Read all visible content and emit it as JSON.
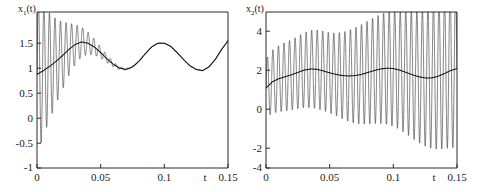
{
  "figure": {
    "background": "#ffffff",
    "curve_color": "#1c1c1c",
    "axis_color": "#2a2a2a"
  },
  "panels": [
    {
      "id": "left",
      "ylabel": "x",
      "ylabel_sub": "1",
      "ylabel_tail": "(t)",
      "xlabel": "t",
      "x_ticks": [
        "0",
        "0.05",
        "0.1",
        "0.15"
      ],
      "y_ticks": [
        "1.5",
        "1",
        "0.5",
        "0",
        "-0.5",
        "-1"
      ]
    },
    {
      "id": "right",
      "ylabel": "x",
      "ylabel_sub": "2",
      "ylabel_tail": "(t)",
      "xlabel": "t",
      "x_ticks": [
        "0",
        "0.05",
        "0.1",
        "0.15"
      ],
      "y_ticks": [
        "4",
        "2",
        "0",
        "-2",
        "-4"
      ]
    }
  ],
  "chart_data": [
    {
      "type": "line",
      "panel": "left",
      "title": "",
      "xlabel": "t",
      "ylabel": "x1(t)",
      "xlim": [
        0,
        0.15
      ],
      "ylim": [
        -1,
        1.5
      ],
      "xticks": [
        0,
        0.05,
        0.1,
        0.15
      ],
      "yticks": [
        -1,
        -0.5,
        0,
        0.5,
        1,
        1.5
      ],
      "grid": false,
      "legend": "none",
      "description": "Rapidly damped high-frequency oscillation superimposed on a slow modulating wave. Oscillation amplitude starts near 1.3 (clipped at axis top) and decays to zero by t~0.07.",
      "series": [
        {
          "name": "slow-envelope-mean",
          "comment": "smooth slowly varying mean component",
          "x": [
            0,
            0.005,
            0.01,
            0.015,
            0.02,
            0.025,
            0.03,
            0.035,
            0.04,
            0.045,
            0.05,
            0.055,
            0.06,
            0.065,
            0.07,
            0.075,
            0.08,
            0.085,
            0.09,
            0.095,
            0.1,
            0.105,
            0.11,
            0.115,
            0.12,
            0.125,
            0.13,
            0.135,
            0.14,
            0.145,
            0.15
          ],
          "values": [
            0.5,
            0.56,
            0.63,
            0.71,
            0.8,
            0.9,
            0.98,
            1.02,
            1.0,
            0.94,
            0.85,
            0.75,
            0.66,
            0.6,
            0.58,
            0.62,
            0.71,
            0.83,
            0.94,
            1.0,
            1.0,
            0.95,
            0.85,
            0.74,
            0.64,
            0.58,
            0.56,
            0.62,
            0.74,
            0.9,
            1.04
          ]
        },
        {
          "name": "fast-oscillation-amplitude",
          "comment": "envelope half-amplitude of the fast oscillation, exponentially damped",
          "x": [
            0,
            0.005,
            0.01,
            0.015,
            0.02,
            0.025,
            0.03,
            0.035,
            0.04,
            0.045,
            0.05,
            0.055,
            0.06,
            0.065,
            0.07,
            0.08,
            0.09,
            0.1,
            0.15
          ],
          "values": [
            1.3,
            1.05,
            0.85,
            0.68,
            0.54,
            0.42,
            0.32,
            0.24,
            0.18,
            0.13,
            0.09,
            0.06,
            0.04,
            0.025,
            0.015,
            0.006,
            0.003,
            0.002,
            0.0
          ]
        }
      ],
      "fast_frequency_hz": 230
    },
    {
      "type": "line",
      "panel": "right",
      "title": "",
      "xlabel": "t",
      "ylabel": "x2(t)",
      "xlim": [
        0,
        0.15
      ],
      "ylim": [
        -4,
        4
      ],
      "xticks": [
        0,
        0.05,
        0.1,
        0.15
      ],
      "yticks": [
        -4,
        -2,
        0,
        2,
        4
      ],
      "grid": false,
      "legend": "none",
      "description": "Growing high-frequency oscillation superimposed on a slow modulating wave. Amplitude grows from about 1.5 at t=0 to about 4 near t=0.15, exceeding the axis limits at the right edge.",
      "series": [
        {
          "name": "slow-envelope-mean",
          "comment": "smooth slowly varying mean component",
          "x": [
            0,
            0.005,
            0.01,
            0.015,
            0.02,
            0.025,
            0.03,
            0.035,
            0.04,
            0.045,
            0.05,
            0.055,
            0.06,
            0.065,
            0.07,
            0.075,
            0.08,
            0.085,
            0.09,
            0.095,
            0.1,
            0.105,
            0.11,
            0.115,
            0.12,
            0.125,
            0.13,
            0.135,
            0.14,
            0.145,
            0.15
          ],
          "values": [
            0.1,
            0.42,
            0.58,
            0.68,
            0.78,
            0.9,
            1.02,
            1.08,
            1.06,
            0.98,
            0.88,
            0.8,
            0.74,
            0.72,
            0.74,
            0.8,
            0.9,
            1.0,
            1.08,
            1.12,
            1.1,
            1.02,
            0.9,
            0.78,
            0.68,
            0.62,
            0.62,
            0.7,
            0.84,
            1.0,
            1.1
          ]
        },
        {
          "name": "fast-oscillation-amplitude",
          "comment": "envelope half-amplitude of the fast oscillation, slowly growing",
          "x": [
            0,
            0.005,
            0.01,
            0.015,
            0.02,
            0.025,
            0.03,
            0.035,
            0.04,
            0.045,
            0.05,
            0.055,
            0.06,
            0.065,
            0.07,
            0.075,
            0.08,
            0.085,
            0.09,
            0.095,
            0.1,
            0.105,
            0.11,
            0.115,
            0.12,
            0.125,
            0.13,
            0.135,
            0.14,
            0.145,
            0.15
          ],
          "values": [
            1.5,
            1.62,
            1.7,
            1.76,
            1.8,
            1.86,
            1.92,
            1.98,
            2.02,
            2.04,
            2.06,
            2.12,
            2.22,
            2.34,
            2.46,
            2.56,
            2.64,
            2.72,
            2.8,
            2.88,
            2.96,
            3.04,
            3.14,
            3.26,
            3.38,
            3.5,
            3.62,
            3.74,
            3.86,
            3.96,
            4.05
          ]
        }
      ],
      "fast_frequency_hz": 230
    }
  ]
}
